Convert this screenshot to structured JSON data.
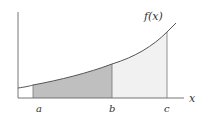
{
  "diagram": {
    "type": "area-under-curve",
    "function_label": "f(x)",
    "axis_label": "x",
    "points": [
      {
        "label": "a"
      },
      {
        "label": "b"
      },
      {
        "label": "c"
      }
    ],
    "regions": [
      {
        "from": "a",
        "to": "b",
        "shade": "dark",
        "color": "#bdbdbd"
      },
      {
        "from": "b",
        "to": "c",
        "shade": "light",
        "color": "#f0f0f0"
      }
    ],
    "colors": {
      "axis": "#555555",
      "curve": "#555555",
      "text": "#333333"
    }
  }
}
